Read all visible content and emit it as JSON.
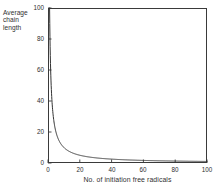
{
  "chart_data": {
    "type": "line",
    "title": "",
    "xlabel": "No. of initiation free radicals",
    "ylabel_lines": [
      "Average",
      "chain",
      "length"
    ],
    "ylabel": "Average chain length",
    "xlim": [
      0,
      100
    ],
    "ylim": [
      0,
      100
    ],
    "xticks": [
      0,
      20,
      40,
      60,
      80,
      100
    ],
    "xtick_labels": [
      "0",
      "20",
      "40",
      "60",
      "80",
      "100"
    ],
    "yticks": [
      0,
      20,
      40,
      60,
      80,
      100
    ],
    "ytick_labels": [
      "0",
      "20",
      "40",
      "60",
      "80",
      "100"
    ],
    "grid": false,
    "legend": false,
    "legend_position": "none",
    "series": [
      {
        "name": "Average chain length",
        "color": "#333333",
        "relation": "y = 100 / x (inverse hyperbolic decay)",
        "x": [
          1,
          1.5,
          2,
          2.5,
          3,
          3.5,
          4,
          5,
          6,
          7,
          8,
          9,
          10,
          12,
          14,
          16,
          18,
          20,
          25,
          30,
          35,
          40,
          45,
          50,
          55,
          60,
          65,
          70,
          75,
          80,
          85,
          90,
          95,
          100
        ],
        "y": [
          100,
          66.7,
          50,
          40,
          33.3,
          28.6,
          25,
          20,
          16.7,
          14.3,
          12.5,
          11.1,
          10,
          8.3,
          7.1,
          6.3,
          5.6,
          5,
          4,
          3.3,
          2.9,
          2.5,
          2.2,
          2,
          1.8,
          1.7,
          1.5,
          1.4,
          1.3,
          1.3,
          1.2,
          1.1,
          1.1,
          1
        ]
      }
    ]
  },
  "figure": {
    "background_color": "#ffffff",
    "frame_color": "#3a3a3a",
    "text_color": "#2e2e2e"
  }
}
